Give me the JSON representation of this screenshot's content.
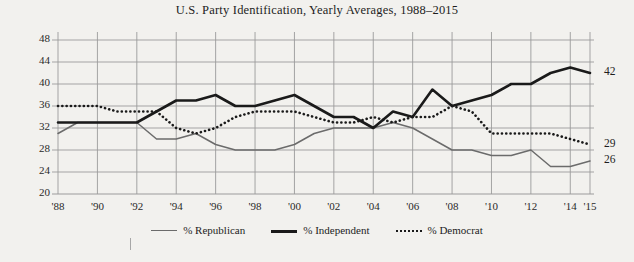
{
  "chart_data": {
    "type": "line",
    "title": "U.S. Party Identification, Yearly Averages, 1988–2015",
    "xlabel": "",
    "ylabel": "",
    "ylim": [
      20,
      48
    ],
    "xlim": [
      1988,
      2015
    ],
    "grid": true,
    "legend_position": "bottom",
    "y_ticks": [
      48,
      44,
      40,
      36,
      32,
      28,
      24,
      20
    ],
    "x_tick_labels": [
      "'88",
      "'90",
      "'92",
      "'94",
      "'96",
      "'98",
      "'00",
      "'02",
      "'04",
      "'06",
      "'08",
      "'10",
      "'12",
      "'14",
      "'15"
    ],
    "x_tick_years": [
      1988,
      1990,
      1992,
      1994,
      1996,
      1998,
      2000,
      2002,
      2004,
      2006,
      2008,
      2010,
      2012,
      2014,
      2015
    ],
    "x": [
      1988,
      1989,
      1990,
      1991,
      1992,
      1993,
      1994,
      1995,
      1996,
      1997,
      1998,
      1999,
      2000,
      2001,
      2002,
      2003,
      2004,
      2005,
      2006,
      2007,
      2008,
      2009,
      2010,
      2011,
      2012,
      2013,
      2014,
      2015
    ],
    "series": [
      {
        "name": "% Republican",
        "style": "thin-solid",
        "color": "#6b6b6b",
        "end_label": "26",
        "values": [
          31,
          33,
          33,
          33,
          33,
          30,
          30,
          31,
          29,
          28,
          28,
          28,
          29,
          31,
          32,
          32,
          32,
          33,
          32,
          30,
          28,
          28,
          27,
          27,
          28,
          25,
          25,
          26
        ]
      },
      {
        "name": "% Independent",
        "style": "thick-solid",
        "color": "#1a1a1a",
        "end_label": "42",
        "values": [
          33,
          33,
          33,
          33,
          33,
          35,
          37,
          37,
          38,
          36,
          36,
          37,
          38,
          36,
          34,
          34,
          32,
          35,
          34,
          39,
          36,
          37,
          38,
          40,
          40,
          42,
          43,
          42
        ]
      },
      {
        "name": "% Democrat",
        "style": "dotted",
        "color": "#1a1a1a",
        "end_label": "29",
        "values": [
          36,
          36,
          36,
          35,
          35,
          35,
          32,
          31,
          32,
          34,
          35,
          35,
          35,
          34,
          33,
          33,
          34,
          33,
          34,
          34,
          36,
          35,
          31,
          31,
          31,
          31,
          30,
          29
        ]
      }
    ]
  },
  "legend": {
    "items": [
      {
        "label": "% Republican",
        "key": "republican"
      },
      {
        "label": "% Independent",
        "key": "independent"
      },
      {
        "label": "% Democrat",
        "key": "democrat"
      }
    ]
  }
}
